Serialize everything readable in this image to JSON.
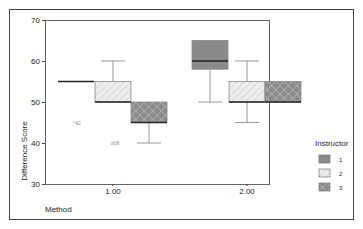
{
  "chart_data": {
    "type": "boxplot",
    "title": "",
    "xlabel": "Method",
    "ylabel": "Difference Score",
    "ylim": [
      30,
      70
    ],
    "yticks": [
      30,
      40,
      50,
      60,
      70
    ],
    "categories": [
      "1.00",
      "2.00"
    ],
    "legend": {
      "title": "Instructor",
      "placement": "right",
      "entries": [
        {
          "label": "1",
          "color": "#8a8a8a",
          "pattern": "solid"
        },
        {
          "label": "2",
          "color": "#ececec",
          "pattern": "diagonal"
        },
        {
          "label": "3",
          "color": "#8e8e8e",
          "pattern": "crosshatch"
        }
      ]
    },
    "series": [
      {
        "name": "1",
        "boxes": [
          {
            "category": "1.00",
            "min": 55,
            "q1": 55,
            "median": 55,
            "q3": 55,
            "max": 55
          },
          {
            "category": "2.00",
            "min": 50,
            "q1": 58,
            "median": 60,
            "q3": 65,
            "max": 65
          }
        ]
      },
      {
        "name": "2",
        "boxes": [
          {
            "category": "1.00",
            "min": 50,
            "q1": 50,
            "median": 50,
            "q3": 55,
            "max": 60
          },
          {
            "category": "2.00",
            "min": 45,
            "q1": 50,
            "median": 50,
            "q3": 55,
            "max": 60
          }
        ]
      },
      {
        "name": "3",
        "boxes": [
          {
            "category": "1.00",
            "min": 40,
            "q1": 45,
            "median": 45,
            "q3": 50,
            "max": 50
          },
          {
            "category": "2.00",
            "min": 50,
            "q1": 50,
            "median": 50,
            "q3": 55,
            "max": 55
          }
        ]
      }
    ],
    "outliers": [
      {
        "category": "1.00",
        "series": "1",
        "value": 45,
        "label": "42",
        "marker": "*"
      },
      {
        "category": "1.00",
        "series": "2",
        "value": 40,
        "label": "08",
        "marker": "o"
      }
    ],
    "grid": false
  }
}
